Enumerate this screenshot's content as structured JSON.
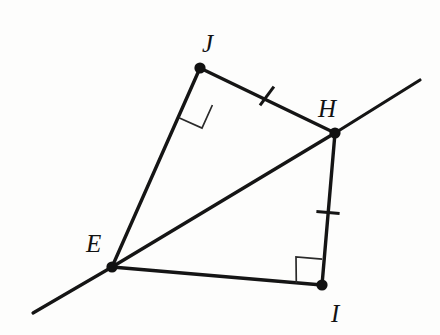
{
  "figure": {
    "kind": "geometry-diagram",
    "background_color": "#fdfdfc",
    "stroke_color": "#151515",
    "canvas": {
      "width": 440,
      "height": 335
    }
  },
  "vertices": [
    {
      "id": "E",
      "label": "E",
      "x": 112,
      "y": 267,
      "label_x": 86,
      "label_y": 252,
      "dot_radius": 5.6
    },
    {
      "id": "J",
      "label": "J",
      "x": 200,
      "y": 68,
      "label_x": 202,
      "label_y": 52,
      "dot_radius": 5.6
    },
    {
      "id": "H",
      "label": "H",
      "x": 335,
      "y": 133,
      "label_x": 318,
      "label_y": 117,
      "dot_radius": 5.6
    },
    {
      "id": "I",
      "label": "I",
      "x": 322,
      "y": 285,
      "label_x": 331,
      "label_y": 322,
      "dot_radius": 5.6
    }
  ],
  "segments": [
    {
      "id": "EJ",
      "label": "segment-E-J",
      "x1": 112,
      "y1": 267,
      "x2": 200,
      "y2": 68
    },
    {
      "id": "JH",
      "label": "segment-J-H",
      "x1": 200,
      "y1": 68,
      "x2": 335,
      "y2": 133
    },
    {
      "id": "HI",
      "label": "segment-H-I",
      "x1": 335,
      "y1": 133,
      "x2": 322,
      "y2": 285
    },
    {
      "id": "IE",
      "label": "segment-I-E",
      "x1": 322,
      "y1": 285,
      "x2": 112,
      "y2": 267
    },
    {
      "id": "EH",
      "label": "diagonal-E-H",
      "x1": 112,
      "y1": 267,
      "x2": 335,
      "y2": 133
    }
  ],
  "rays": [
    {
      "id": "ray-lower-left",
      "label": "ray-through-E-extended",
      "x1": 112,
      "y1": 267,
      "x2": 33,
      "y2": 313
    },
    {
      "id": "ray-upper-right",
      "label": "ray-through-H-extended",
      "x1": 335,
      "y1": 133,
      "x2": 420,
      "y2": 80
    }
  ],
  "right_angles": [
    {
      "id": "angle-J",
      "at": "J",
      "label": "right-angle-at-J",
      "points": "178.9,117.7 202.0,128.1 212.4,105.0"
    },
    {
      "id": "angle-I",
      "at": "I",
      "label": "right-angle-at-I",
      "points": "296.3,283.0 296.0,257.0 322.2,259.2"
    }
  ],
  "tick_marks": [
    {
      "id": "tick-JH",
      "on": "JH",
      "label": "congruence-tick-on-JH",
      "x1": 260.0,
      "y1": 105.4,
      "x2": 273.9,
      "y2": 86.6
    },
    {
      "id": "tick-HI",
      "on": "HI",
      "label": "congruence-tick-on-HI",
      "x1": 316.4,
      "y1": 211.4,
      "x2": 339.6,
      "y2": 213.4
    }
  ]
}
